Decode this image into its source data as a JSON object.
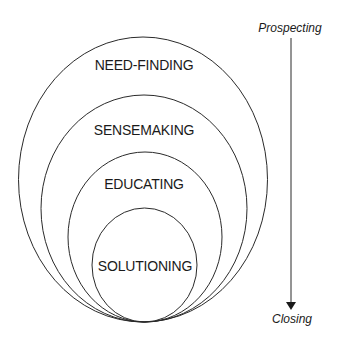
{
  "diagram": {
    "type": "nested-ellipses",
    "stages": [
      {
        "label": "NEED-FINDING"
      },
      {
        "label": "SENSEMAKING"
      },
      {
        "label": "EDUCATING"
      },
      {
        "label": "SOLUTIONING"
      }
    ],
    "axis": {
      "start_label": "Prospecting",
      "end_label": "Closing",
      "direction": "down"
    },
    "colors": {
      "stroke": "#2a2a2a",
      "text": "#1a1a1a",
      "background": "#ffffff"
    }
  }
}
